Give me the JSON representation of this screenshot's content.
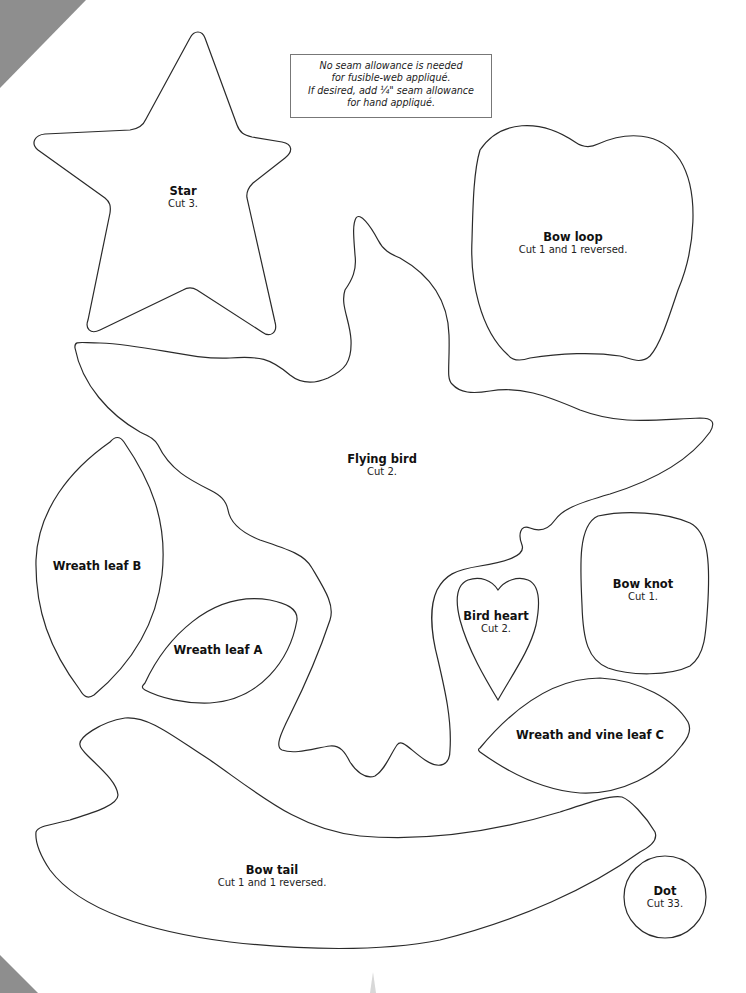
{
  "note": {
    "lines": [
      "No seam allowance is needed",
      "for fusible-web appliqué.",
      "If desired, add ¼\" seam allowance",
      "for hand appliqué."
    ]
  },
  "pieces": {
    "star": {
      "name": "Star",
      "cut": "Cut 3."
    },
    "bow_loop": {
      "name": "Bow loop",
      "cut": "Cut 1 and 1 reversed."
    },
    "flying_bird": {
      "name": "Flying bird",
      "cut": "Cut 2."
    },
    "wreath_leaf_b": {
      "name": "Wreath leaf B",
      "cut": ""
    },
    "wreath_leaf_a": {
      "name": "Wreath leaf A",
      "cut": ""
    },
    "bird_heart": {
      "name": "Bird heart",
      "cut": "Cut 2."
    },
    "bow_knot": {
      "name": "Bow knot",
      "cut": "Cut 1."
    },
    "wreath_vine_leaf_c": {
      "name": "Wreath and vine leaf C",
      "cut": ""
    },
    "bow_tail": {
      "name": "Bow tail",
      "cut": "Cut 1 and 1 reversed."
    },
    "dot": {
      "name": "Dot",
      "cut": "Cut 33."
    }
  },
  "colors": {
    "outline": "#2a2a2a",
    "background": "#ffffff",
    "corner_texture": "#8e8e8e"
  }
}
